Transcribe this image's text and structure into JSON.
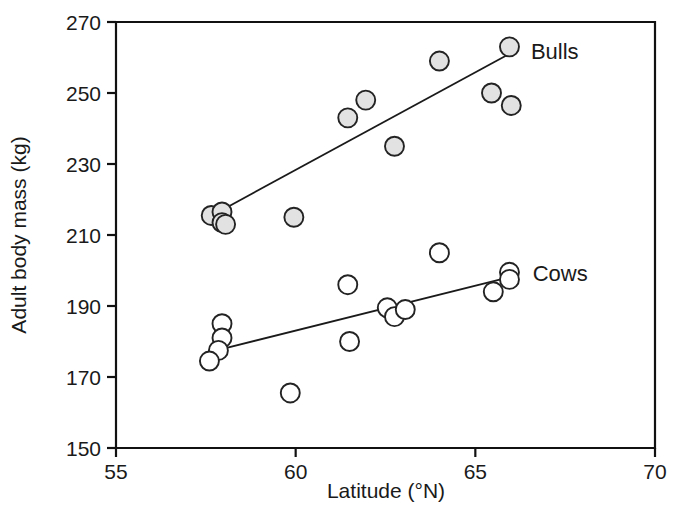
{
  "chart_data": {
    "type": "scatter",
    "title": "",
    "xlabel": "Latitude (°N)",
    "ylabel": "Adult body mass (kg)",
    "xlim": [
      55,
      70
    ],
    "ylim": [
      150,
      270
    ],
    "xticks": [
      55,
      60,
      65,
      70
    ],
    "yticks": [
      150,
      170,
      190,
      210,
      230,
      250,
      270
    ],
    "xtick_labels": [
      "55",
      "60",
      "65",
      "70"
    ],
    "ytick_labels": [
      "150",
      "170",
      "190",
      "210",
      "230",
      "250",
      "270"
    ],
    "grid": false,
    "legend_position": "inline-right-of-fit-lines",
    "series": [
      {
        "name": "Bulls",
        "label": "Bulls",
        "marker": "filled-circle",
        "marker_fill": "#e2e2e2",
        "marker_stroke": "#232323",
        "points": [
          {
            "x": 57.65,
            "y": 215.5
          },
          {
            "x": 57.95,
            "y": 216.5
          },
          {
            "x": 57.95,
            "y": 213.5
          },
          {
            "x": 58.05,
            "y": 213.0
          },
          {
            "x": 59.95,
            "y": 215.0
          },
          {
            "x": 61.45,
            "y": 243.0
          },
          {
            "x": 61.95,
            "y": 248.0
          },
          {
            "x": 62.75,
            "y": 235.0
          },
          {
            "x": 64.0,
            "y": 259.0
          },
          {
            "x": 65.95,
            "y": 263.0
          },
          {
            "x": 65.45,
            "y": 250.0
          },
          {
            "x": 66.0,
            "y": 246.5
          }
        ],
        "fit_line": {
          "x1": 57.85,
          "y1": 216.5,
          "x2": 65.85,
          "y2": 260.5
        }
      },
      {
        "name": "Cows",
        "label": "Cows",
        "marker": "open-circle",
        "marker_fill": "#ffffff",
        "marker_stroke": "#232323",
        "points": [
          {
            "x": 57.95,
            "y": 185.0
          },
          {
            "x": 57.95,
            "y": 181.0
          },
          {
            "x": 57.85,
            "y": 177.5
          },
          {
            "x": 57.6,
            "y": 174.5
          },
          {
            "x": 59.85,
            "y": 165.5
          },
          {
            "x": 61.45,
            "y": 196.0
          },
          {
            "x": 61.5,
            "y": 180.0
          },
          {
            "x": 62.55,
            "y": 189.5
          },
          {
            "x": 62.75,
            "y": 187.0
          },
          {
            "x": 63.05,
            "y": 189.0
          },
          {
            "x": 64.0,
            "y": 205.0
          },
          {
            "x": 65.5,
            "y": 194.0
          },
          {
            "x": 65.95,
            "y": 199.5
          },
          {
            "x": 65.95,
            "y": 197.5
          }
        ],
        "fit_line": {
          "x1": 57.8,
          "y1": 177.5,
          "x2": 65.9,
          "y2": 198.0
        }
      }
    ]
  },
  "axes": {
    "x_axis_title": "Latitude (°N)",
    "y_axis_title": "Adult body mass (kg)"
  },
  "labels": {
    "bulls": "Bulls",
    "cows": "Cows"
  }
}
